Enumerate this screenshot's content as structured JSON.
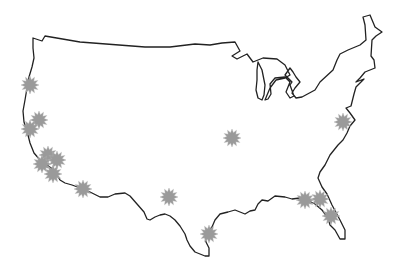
{
  "map": {
    "title": "Contiguous United States",
    "outline_color": "#222222",
    "background_color": "#ffffff",
    "marker": {
      "icon": "starburst-icon",
      "color": "#9a9a9a",
      "radius": 9
    },
    "markers": [
      {
        "id": "m1",
        "x": 30,
        "y": 85
      },
      {
        "id": "m2",
        "x": 39,
        "y": 120
      },
      {
        "id": "m3",
        "x": 30,
        "y": 129
      },
      {
        "id": "m4",
        "x": 48,
        "y": 155
      },
      {
        "id": "m5",
        "x": 57,
        "y": 160
      },
      {
        "id": "m6",
        "x": 42,
        "y": 164
      },
      {
        "id": "m7",
        "x": 53,
        "y": 174
      },
      {
        "id": "m8",
        "x": 83,
        "y": 189
      },
      {
        "id": "m9",
        "x": 169,
        "y": 197
      },
      {
        "id": "m10",
        "x": 232,
        "y": 138
      },
      {
        "id": "m11",
        "x": 343,
        "y": 122
      },
      {
        "id": "m12",
        "x": 305,
        "y": 200
      },
      {
        "id": "m13",
        "x": 320,
        "y": 199
      },
      {
        "id": "m14",
        "x": 331,
        "y": 216
      },
      {
        "id": "m15",
        "x": 209,
        "y": 234
      }
    ]
  }
}
